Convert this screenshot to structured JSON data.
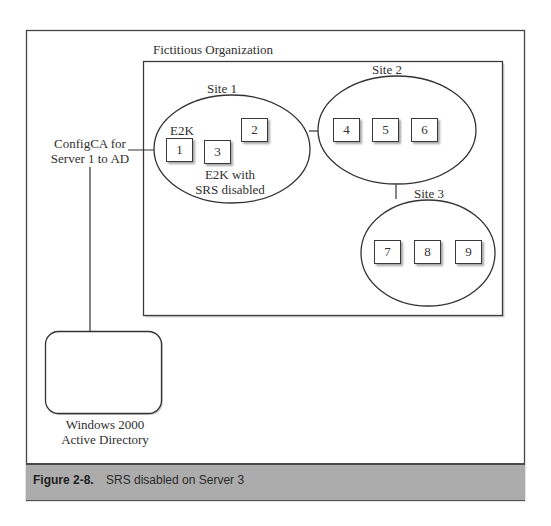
{
  "figure": {
    "number": "Figure 2-8.",
    "caption": "SRS disabled on Server 3"
  },
  "organization": {
    "label": "Fictitious Organization"
  },
  "connector_label": {
    "line1": "ConfigCA for",
    "line2": "Server 1 to AD"
  },
  "active_directory": {
    "line1": "Windows 2000",
    "line2": "Active Directory"
  },
  "sites": [
    {
      "label": "Site 1",
      "annotations": {
        "server1": "E2K",
        "server3_line1": "E2K with",
        "server3_line2": "SRS disabled"
      },
      "servers": [
        "1",
        "2",
        "3"
      ]
    },
    {
      "label": "Site 2",
      "servers": [
        "4",
        "5",
        "6"
      ]
    },
    {
      "label": "Site 3",
      "servers": [
        "7",
        "8",
        "9"
      ]
    }
  ],
  "colors": {
    "stroke": "#3a3a3a",
    "caption_band": "#acacac",
    "background": "#ffffff"
  }
}
